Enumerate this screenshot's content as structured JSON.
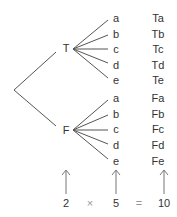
{
  "diagram": {
    "type": "tree-diagram",
    "root": {
      "x": 14,
      "y": 90
    },
    "first_level": [
      {
        "label": "T",
        "x": 66,
        "y": 48,
        "fan_x": 74
      },
      {
        "label": "F",
        "x": 66,
        "y": 130,
        "fan_x": 74
      }
    ],
    "second_level_labels": [
      "a",
      "b",
      "c",
      "d",
      "e"
    ],
    "leaf_x": 116,
    "outcome_x": 157,
    "rows_T": [
      18,
      34,
      49,
      65,
      80
    ],
    "rows_F": [
      98,
      114,
      129,
      145,
      161
    ],
    "outcomes": {
      "T": [
        "Ta",
        "Tb",
        "Tc",
        "Td",
        "Te"
      ],
      "F": [
        "Fa",
        "Fb",
        "Fc",
        "Fd",
        "Fe"
      ]
    },
    "line_color": "#555555",
    "arrow_color": "#777777"
  },
  "equation": {
    "factor1": "2",
    "times": "×",
    "factor2": "5",
    "equals": "=",
    "result": "10"
  }
}
